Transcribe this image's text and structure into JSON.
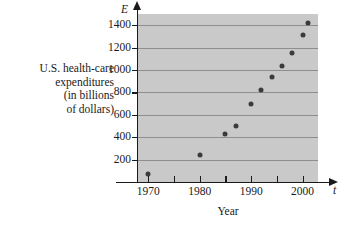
{
  "chart_data": {
    "type": "scatter",
    "title": "",
    "xlabel": "Year",
    "ylabel": "U.S. health-care expenditures (in billions of dollars)",
    "ylabel_lines": [
      "U.S. health-care",
      "expenditures",
      "(in billions",
      "of dollars)"
    ],
    "x_axis_symbol": "t",
    "y_axis_symbol": "E",
    "xlim": [
      1968,
      2003
    ],
    "ylim": [
      0,
      1500
    ],
    "grid": true,
    "grid_axis": "y",
    "legend": null,
    "x_ticks_major": [
      1970,
      1980,
      1990,
      2000
    ],
    "x_ticks_minor": [
      1975,
      1985,
      1995
    ],
    "x_tick_labels": [
      "1970",
      "1980",
      "1990",
      "2000"
    ],
    "y_ticks": [
      200,
      400,
      600,
      800,
      1000,
      1200,
      1400
    ],
    "y_tick_labels": [
      "200",
      "400",
      "600",
      "800",
      "1000",
      "1200",
      "1400"
    ],
    "plot_bg_color": "#c9c9c9",
    "grid_color": "#8e8e8e",
    "marker_color": "#3b3b3b",
    "axis_color": "#1a1a1a",
    "x": [
      1970,
      1980,
      1985,
      1987,
      1990,
      1992,
      1994,
      1996,
      1998,
      2000,
      2001
    ],
    "y": [
      74,
      245,
      428,
      500,
      696,
      820,
      937,
      1040,
      1150,
      1310,
      1420
    ],
    "points": [
      {
        "year": 1970,
        "value": 74
      },
      {
        "year": 1980,
        "value": 245
      },
      {
        "year": 1985,
        "value": 428
      },
      {
        "year": 1987,
        "value": 500
      },
      {
        "year": 1990,
        "value": 696
      },
      {
        "year": 1992,
        "value": 820
      },
      {
        "year": 1994,
        "value": 937
      },
      {
        "year": 1996,
        "value": 1040
      },
      {
        "year": 1998,
        "value": 1150
      },
      {
        "year": 2000,
        "value": 1310
      },
      {
        "year": 2001,
        "value": 1420
      }
    ]
  }
}
